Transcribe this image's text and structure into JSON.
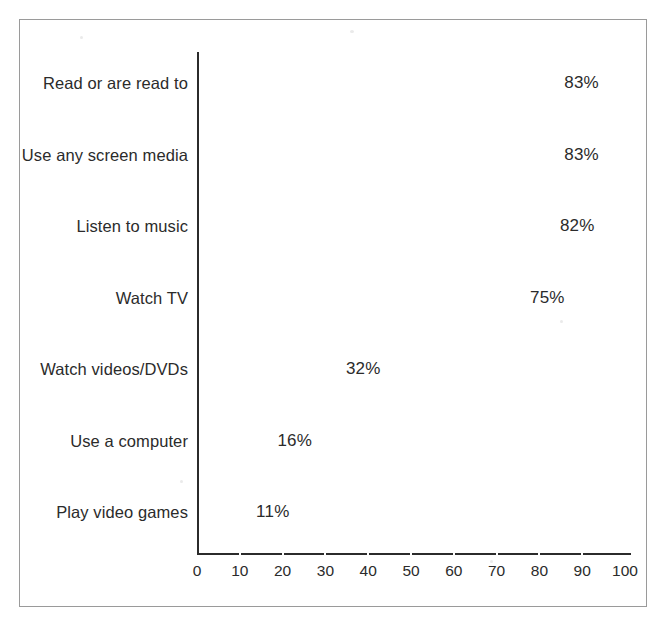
{
  "chart_data": {
    "type": "bar",
    "orientation": "horizontal",
    "title": "",
    "subtitle": "",
    "xlabel": "",
    "ylabel": "",
    "xlim": [
      0,
      100
    ],
    "xtick_step": 10,
    "grid": true,
    "grid_style": "white separator bands across bars every 10 units",
    "legend": null,
    "value_suffix": "%",
    "categories": [
      "Read or are read to",
      "Use any screen media",
      "Listen to music",
      "Watch TV",
      "Watch videos/DVDs",
      "Use a computer",
      "Play video games"
    ],
    "values": [
      83,
      83,
      82,
      75,
      32,
      16,
      11
    ],
    "data_labels": [
      "83%",
      "83%",
      "82%",
      "75%",
      "32%",
      "16%",
      "11%"
    ],
    "tick_labels": [
      "0",
      "10",
      "20",
      "30",
      "40",
      "50",
      "60",
      "70",
      "80",
      "90",
      "100"
    ],
    "tick_values": [
      0,
      10,
      20,
      30,
      40,
      50,
      60,
      70,
      80,
      90,
      100
    ],
    "colors": {
      "bar_fill": "#1b1b1b",
      "axis": "#2b2b2b",
      "text": "#2b2b2b",
      "frame": "#9a9a9a",
      "background": "#ffffff",
      "gridline": "#ffffff"
    }
  }
}
